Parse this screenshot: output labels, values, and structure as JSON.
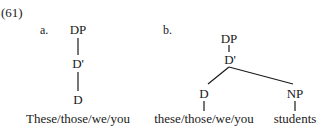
{
  "example_number": "(61)",
  "trees": [
    {
      "label": "a.",
      "nodes": {
        "root": "DP",
        "bar": "D'",
        "head": "D"
      },
      "terminal": "These/those/we/you"
    },
    {
      "label": "b.",
      "nodes": {
        "root": "DP",
        "bar": "D'",
        "head": "D",
        "complement": "NP"
      },
      "terminals": {
        "head": "these/those/we/you",
        "complement": "students"
      }
    }
  ]
}
